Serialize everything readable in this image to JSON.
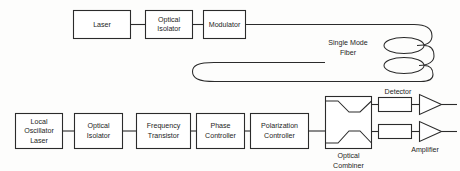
{
  "diagram": {
    "colors": {
      "background": "#fdfdfc",
      "line": "#2b2b2b",
      "box_fill": "#ffffff",
      "text": "#1d1d1d"
    },
    "transmit_chain": {
      "laser": {
        "label": "Laser"
      },
      "optical_isolator": {
        "line1": "Optical",
        "line2": "Isolator"
      },
      "modulator": {
        "label": "Modulator"
      }
    },
    "fiber": {
      "line1": "Single Mode",
      "line2": "Fiber"
    },
    "local_chain": {
      "local_oscillator_laser": {
        "line1": "Local",
        "line2": "Oscillator",
        "line3": "Laser"
      },
      "optical_isolator": {
        "line1": "Optical",
        "line2": "Isolator"
      },
      "frequency_transistor": {
        "line1": "Frequency",
        "line2": "Transistor"
      },
      "phase_controller": {
        "line1": "Phase",
        "line2": "Controller"
      },
      "polarization_controller": {
        "line1": "Polarization",
        "line2": "Controller"
      }
    },
    "receiver": {
      "optical_combiner": {
        "line1": "Optical",
        "line2": "Combiner"
      },
      "detector": {
        "label": "Detector"
      },
      "amplifier": {
        "label": "Amplifier"
      }
    }
  }
}
